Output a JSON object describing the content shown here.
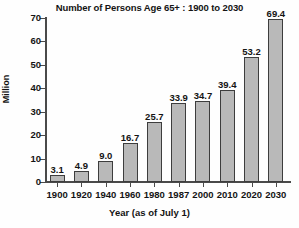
{
  "chart_data": {
    "type": "bar",
    "title": "Number of Persons Age 65+ : 1900 to 2030",
    "xlabel": "Year (as of July 1)",
    "ylabel": "Million",
    "categories": [
      "1900",
      "1920",
      "1940",
      "1960",
      "1980",
      "1987",
      "2000",
      "2010",
      "2020",
      "2030"
    ],
    "values": [
      3.1,
      4.9,
      9.0,
      16.7,
      25.7,
      33.9,
      34.7,
      39.4,
      53.2,
      69.4
    ],
    "value_labels": [
      "3.1",
      "4.9",
      "9.0",
      "16.7",
      "25.7",
      "33.9",
      "34.7",
      "39.4",
      "53.2",
      "69.4"
    ],
    "ylim": [
      0,
      70
    ],
    "yticks": [
      0,
      10,
      20,
      30,
      40,
      50,
      60,
      70
    ],
    "ytick_labels": [
      "0",
      "10",
      "20",
      "30",
      "40",
      "50",
      "60",
      "70"
    ],
    "grid": false,
    "legend": "none",
    "bar_color": "#b9b9b9",
    "bar_edge_color": "#3d3d3d",
    "axis_color": "#4a4a4a",
    "text_color": "#141414",
    "background_color": "#fefefe"
  }
}
